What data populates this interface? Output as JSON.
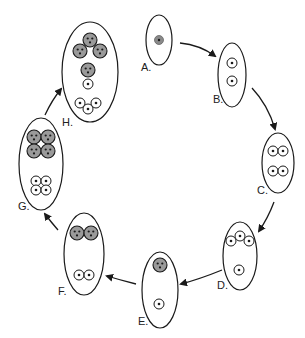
{
  "diagram": {
    "type": "cycle",
    "stages": [
      {
        "id": "A",
        "label": "A.",
        "description": "single cell with one shaded nucleus"
      },
      {
        "id": "B",
        "label": "B.",
        "description": "two small nuclei"
      },
      {
        "id": "C",
        "label": "C.",
        "description": "two pairs of nuclei"
      },
      {
        "id": "D",
        "label": "D.",
        "description": "three nuclei at top, one at bottom"
      },
      {
        "id": "E",
        "label": "E.",
        "description": "one shaded cell with three nuclei at top, one nucleus at bottom"
      },
      {
        "id": "F",
        "label": "F.",
        "description": "two shaded cells at top, two nuclei at bottom"
      },
      {
        "id": "G",
        "label": "G.",
        "description": "four shaded cells at top, four nuclei at bottom"
      },
      {
        "id": "H",
        "label": "H.",
        "description": "three shaded cells at top, one shaded cell and one nucleus middle, three nuclei bottom"
      }
    ],
    "arrows": [
      {
        "from": "A",
        "to": "B"
      },
      {
        "from": "B",
        "to": "C"
      },
      {
        "from": "C",
        "to": "D"
      },
      {
        "from": "D",
        "to": "E"
      },
      {
        "from": "E",
        "to": "F"
      },
      {
        "from": "F",
        "to": "G"
      },
      {
        "from": "G",
        "to": "H"
      }
    ],
    "colors": {
      "stroke": "#1a1a1a",
      "shade": "#9a9a9a",
      "background": "#ffffff"
    }
  }
}
